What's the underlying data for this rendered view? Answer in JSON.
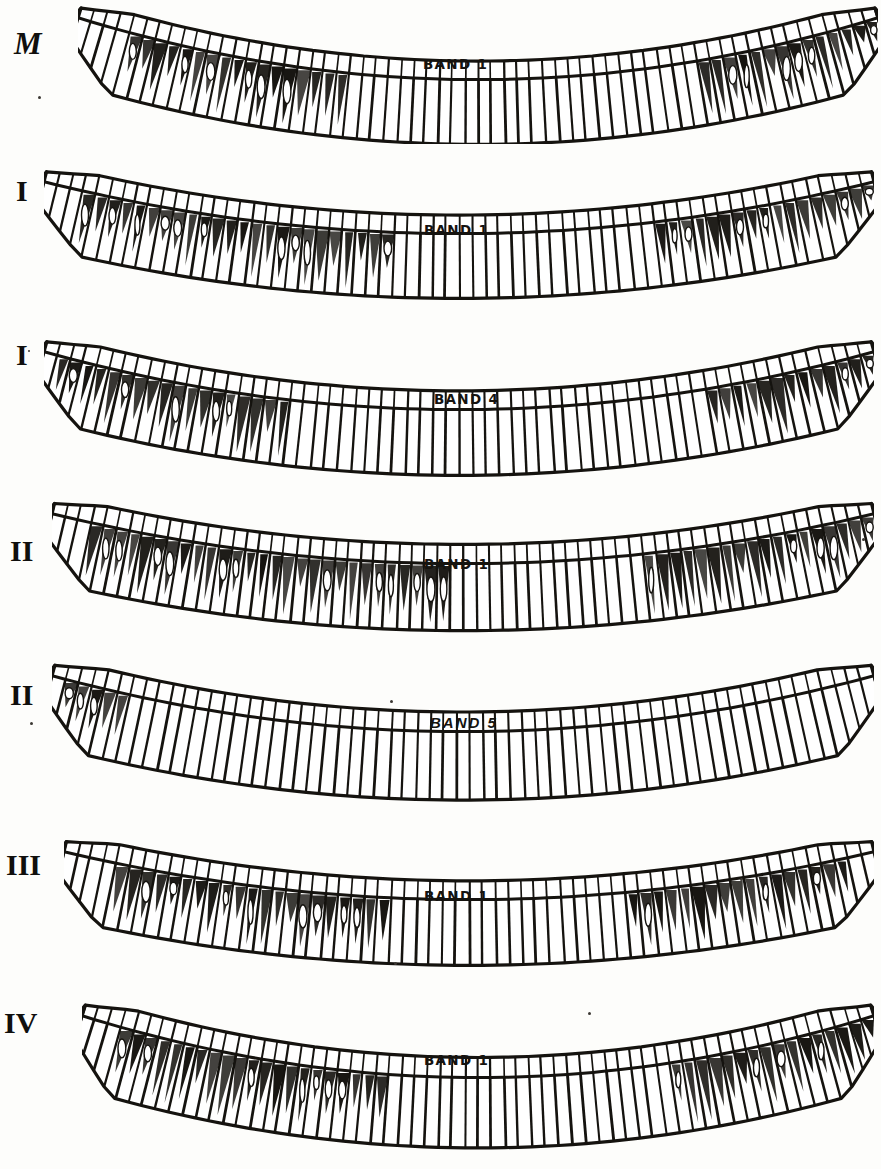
{
  "plate": {
    "title": "Comparative plate of seven segmented specimen bands",
    "background_color": "#fdfdfb",
    "ink_color": "#15130f",
    "rows": [
      {
        "id": "row-m",
        "numeral": "M",
        "numeral_style": "italic",
        "band_label": "BAND 1",
        "band_label_style": "bold",
        "top": 4,
        "numeral_top": 28,
        "numeral_left": 14,
        "label_left": 423,
        "label_top": 56,
        "specimen_left": 78,
        "specimen_top": 4,
        "width": 800,
        "height": 140,
        "curve_depth": 62,
        "segments": 62,
        "left_tilt": -17,
        "right_tilt": 15,
        "dark_zones": [
          [
            0.07,
            0.34
          ],
          [
            0.78,
            1.0
          ]
        ]
      },
      {
        "id": "row-i-1",
        "numeral": "I",
        "numeral_style": "upright",
        "band_label": "BAND 1",
        "band_label_style": "bold",
        "top": 168,
        "numeral_top": 176,
        "numeral_left": 16,
        "label_left": 424,
        "label_top": 222,
        "specimen_left": 44,
        "specimen_top": 168,
        "width": 830,
        "height": 140,
        "curve_depth": 52,
        "segments": 64,
        "left_tilt": -14,
        "right_tilt": 14,
        "dark_zones": [
          [
            0.05,
            0.42
          ],
          [
            0.74,
            1.0
          ]
        ]
      },
      {
        "id": "row-i-2",
        "numeral": "I",
        "numeral_style": "upright",
        "band_label": "BAND 4",
        "band_label_style": "bold",
        "top": 338,
        "numeral_top": 340,
        "numeral_left": 16,
        "label_left": 434,
        "label_top": 391,
        "specimen_left": 44,
        "specimen_top": 338,
        "width": 830,
        "height": 142,
        "curve_depth": 58,
        "segments": 64,
        "left_tilt": -16,
        "right_tilt": 16,
        "dark_zones": [
          [
            0.02,
            0.3
          ],
          [
            0.8,
            1.0
          ]
        ]
      },
      {
        "id": "row-ii-1",
        "numeral": "II",
        "numeral_style": "upright",
        "band_label": "BAND 1",
        "band_label_style": "bold",
        "top": 500,
        "numeral_top": 536,
        "numeral_left": 10,
        "label_left": 424,
        "label_top": 556,
        "specimen_left": 52,
        "specimen_top": 500,
        "width": 822,
        "height": 145,
        "curve_depth": 50,
        "segments": 64,
        "left_tilt": -15,
        "right_tilt": 15,
        "dark_zones": [
          [
            0.04,
            0.48
          ],
          [
            0.72,
            1.0
          ]
        ]
      },
      {
        "id": "row-ii-2",
        "numeral": "II",
        "numeral_style": "upright",
        "band_label": "BAND 5",
        "band_label_style": "thin",
        "top": 662,
        "numeral_top": 680,
        "numeral_left": 10,
        "label_left": 430,
        "label_top": 714,
        "specimen_left": 52,
        "specimen_top": 662,
        "width": 822,
        "height": 148,
        "curve_depth": 56,
        "segments": 63,
        "left_tilt": -14,
        "right_tilt": 14,
        "dark_zones": [
          [
            0.02,
            0.1
          ]
        ]
      },
      {
        "id": "row-iii",
        "numeral": "III",
        "numeral_style": "upright",
        "band_label": "BAND 1",
        "band_label_style": "bold",
        "top": 838,
        "numeral_top": 850,
        "numeral_left": 6,
        "label_left": 424,
        "label_top": 888,
        "specimen_left": 64,
        "specimen_top": 838,
        "width": 810,
        "height": 142,
        "curve_depth": 48,
        "segments": 62,
        "left_tilt": -14,
        "right_tilt": 14,
        "dark_zones": [
          [
            0.06,
            0.4
          ],
          [
            0.7,
            0.96
          ]
        ]
      },
      {
        "id": "row-iv",
        "numeral": "IV",
        "numeral_style": "upright",
        "band_label": "BAND 1",
        "band_label_style": "bold",
        "top": 1002,
        "numeral_top": 1008,
        "numeral_left": 4,
        "label_left": 424,
        "label_top": 1052,
        "specimen_left": 82,
        "specimen_top": 1002,
        "width": 792,
        "height": 152,
        "curve_depth": 62,
        "segments": 62,
        "left_tilt": -17,
        "right_tilt": 16,
        "dark_zones": [
          [
            0.05,
            0.38
          ],
          [
            0.74,
            1.0
          ]
        ]
      }
    ],
    "specks": [
      {
        "left": 38,
        "top": 96,
        "size": 3
      },
      {
        "left": 28,
        "top": 350,
        "size": 2
      },
      {
        "left": 862,
        "top": 538,
        "size": 3
      },
      {
        "left": 30,
        "top": 722,
        "size": 3
      },
      {
        "left": 390,
        "top": 700,
        "size": 3
      },
      {
        "left": 740,
        "top": 878,
        "size": 3
      },
      {
        "left": 394,
        "top": 962,
        "size": 3
      },
      {
        "left": 588,
        "top": 1012,
        "size": 3
      }
    ]
  }
}
